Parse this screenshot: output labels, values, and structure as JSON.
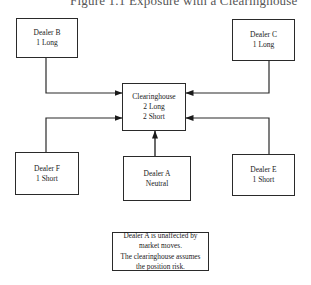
{
  "figure": {
    "title": "Figure 1.1  Exposure with a Clearinghouse"
  },
  "nodes": {
    "dealer_b": {
      "name": "Dealer B",
      "position": "1 Long"
    },
    "dealer_c": {
      "name": "Dealer C",
      "position": "1 Long"
    },
    "clearinghouse": {
      "name": "Clearinghouse",
      "line1": "2 Long",
      "line2": "2 Short"
    },
    "dealer_a": {
      "name": "Dealer A",
      "position": "Neutral"
    },
    "dealer_f": {
      "name": "Dealer F",
      "position": "1 Short"
    },
    "dealer_e": {
      "name": "Dealer E",
      "position": "1 Short"
    }
  },
  "edges": [
    {
      "from": "Dealer B",
      "to": "Clearinghouse"
    },
    {
      "from": "Dealer C",
      "to": "Clearinghouse"
    },
    {
      "from": "Dealer F",
      "to": "Clearinghouse"
    },
    {
      "from": "Dealer E",
      "to": "Clearinghouse"
    },
    {
      "from": "Dealer A",
      "to": "Clearinghouse"
    }
  ],
  "note": {
    "line1": "Dealer A is unaffected by",
    "line2": "market moves.",
    "line3": "The clearinghouse assumes",
    "line4": "the position risk."
  },
  "colors": {
    "line": "#2a2a2a",
    "background": "#ffffff"
  }
}
